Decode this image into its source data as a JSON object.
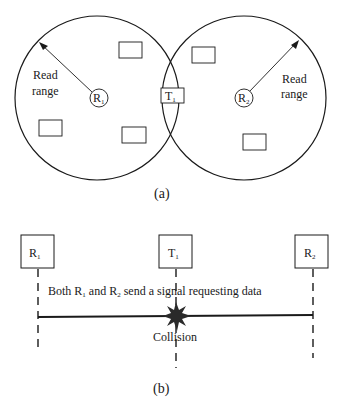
{
  "figure_a": {
    "caption": "(a)",
    "reader1": {
      "label": "R",
      "sub": "1",
      "range_label_line1": "Read",
      "range_label_line2": "range"
    },
    "reader2": {
      "label": "R",
      "sub": "2",
      "range_label_line1": "Read",
      "range_label_line2": "range"
    },
    "tag": {
      "label": "T",
      "sub": "1"
    },
    "other_tags_count": 5
  },
  "figure_b": {
    "caption": "(b)",
    "participants": [
      {
        "label": "R",
        "sub": "1"
      },
      {
        "label": "T",
        "sub": "1"
      },
      {
        "label": "R",
        "sub": "2"
      }
    ],
    "message": {
      "part1": "Both R",
      "sub1": "1",
      "part2": " and R",
      "sub2": "2",
      "part3": " send a signal requesting data"
    },
    "collision_label": "Collision"
  },
  "colors": {
    "ink": "#1a1a1a",
    "background": "#ffffff"
  }
}
